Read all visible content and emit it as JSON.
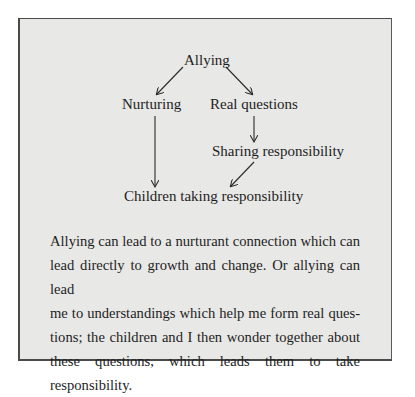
{
  "figure": {
    "nodes": {
      "allying": "Allying",
      "nurturing": "Nurturing",
      "real_questions": "Real questions",
      "sharing_responsibility": "Sharing responsibility",
      "children_taking_responsibility": "Children taking responsibility"
    },
    "edges": [
      {
        "from": "Allying",
        "to": "Nurturing"
      },
      {
        "from": "Allying",
        "to": "Real questions"
      },
      {
        "from": "Real questions",
        "to": "Sharing responsibility"
      },
      {
        "from": "Nurturing",
        "to": "Children taking responsibility"
      },
      {
        "from": "Sharing responsibility",
        "to": "Children taking responsibility"
      }
    ],
    "caption_lines": [
      "Allying can lead to a nurturant connection which can",
      "lead directly to growth and change. Or allying can lead",
      "me to understandings which help me form real ques-",
      "tions; the children and I then wonder together about",
      "these questions, which leads them to take responsibility."
    ]
  }
}
